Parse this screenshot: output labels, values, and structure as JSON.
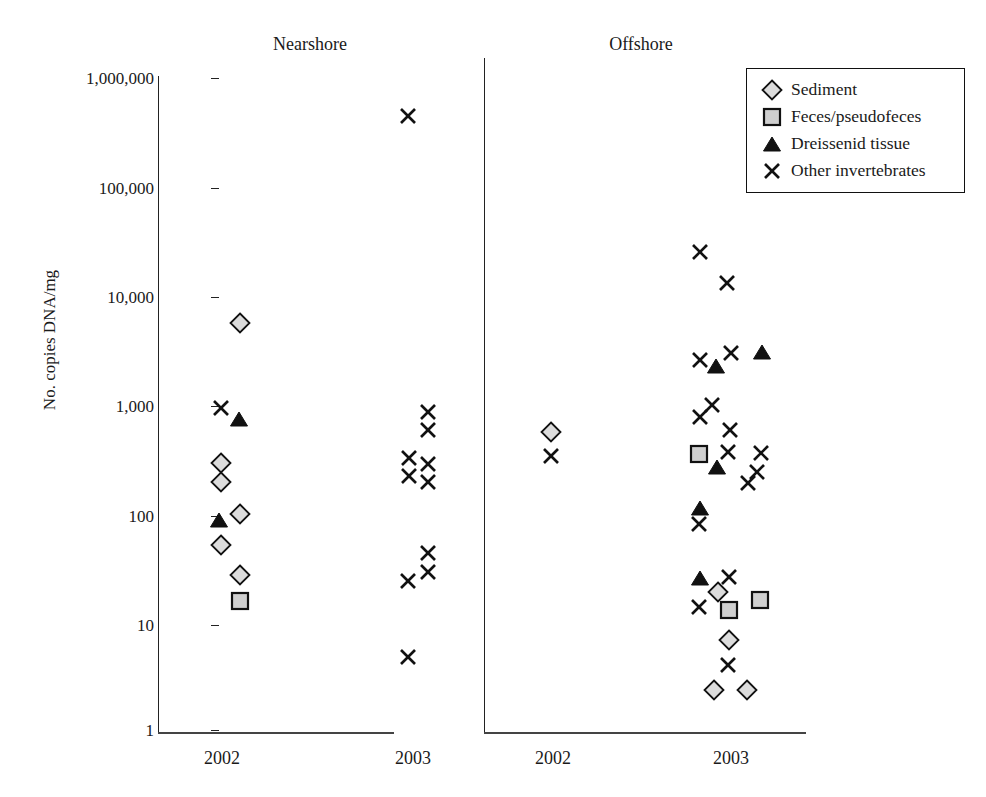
{
  "chart_data": {
    "type": "scatter",
    "title": "",
    "xlabel": "",
    "ylabel": "No. copies DNA/mg",
    "yscale": "log",
    "ylim": [
      1,
      1000000
    ],
    "yticks": [
      {
        "value": 1000000,
        "label": "1,000,000"
      },
      {
        "value": 100000,
        "label": "100,000"
      },
      {
        "value": 10000,
        "label": "10,000"
      },
      {
        "value": 1000,
        "label": "1,000"
      },
      {
        "value": 100,
        "label": "100"
      },
      {
        "value": 10,
        "label": "10"
      },
      {
        "value": 1,
        "label": "1"
      }
    ],
    "grid": false,
    "legend_position": "top-right",
    "panels": [
      {
        "name": "Nearshore",
        "groups": [
          "2002",
          "2003"
        ]
      },
      {
        "name": "Offshore",
        "groups": [
          "2002",
          "2003"
        ]
      }
    ],
    "series": [
      {
        "name": "Sediment",
        "marker": "diamond",
        "fill": "#d9d9d9",
        "stroke": "#111111"
      },
      {
        "name": "Feces/pseudofeces",
        "marker": "square",
        "fill": "#cccccc",
        "stroke": "#111111"
      },
      {
        "name": "Dreissenid tissue",
        "marker": "triangle",
        "fill": "#111111",
        "stroke": "#111111"
      },
      {
        "name": "Other invertebrates",
        "marker": "x",
        "fill": "none",
        "stroke": "#111111"
      }
    ],
    "points": [
      {
        "panel": "Nearshore",
        "group": "2002",
        "series": "Sediment",
        "value": 5500,
        "px": 240,
        "py": 323
      },
      {
        "panel": "Nearshore",
        "group": "2002",
        "series": "Other invertebrates",
        "value": 900,
        "px": 221,
        "py": 408
      },
      {
        "panel": "Nearshore",
        "group": "2002",
        "series": "Dreissenid tissue",
        "value": 750,
        "px": 239,
        "py": 419
      },
      {
        "panel": "Nearshore",
        "group": "2002",
        "series": "Sediment",
        "value": 290,
        "px": 221,
        "py": 463
      },
      {
        "panel": "Nearshore",
        "group": "2002",
        "series": "Sediment",
        "value": 220,
        "px": 221,
        "py": 482
      },
      {
        "panel": "Nearshore",
        "group": "2002",
        "series": "Sediment",
        "value": 100,
        "px": 240,
        "py": 514
      },
      {
        "panel": "Nearshore",
        "group": "2002",
        "series": "Dreissenid tissue",
        "value": 85,
        "px": 219,
        "py": 520
      },
      {
        "panel": "Nearshore",
        "group": "2002",
        "series": "Sediment",
        "value": 55,
        "px": 221,
        "py": 545
      },
      {
        "panel": "Nearshore",
        "group": "2002",
        "series": "Sediment",
        "value": 28,
        "px": 240,
        "py": 575
      },
      {
        "panel": "Nearshore",
        "group": "2002",
        "series": "Feces/pseudofeces",
        "value": 17,
        "px": 240,
        "py": 601
      },
      {
        "panel": "Nearshore",
        "group": "2003",
        "series": "Other invertebrates",
        "value": 420000,
        "px": 408,
        "py": 116
      },
      {
        "panel": "Nearshore",
        "group": "2003",
        "series": "Other invertebrates",
        "value": 850,
        "px": 428,
        "py": 412
      },
      {
        "panel": "Nearshore",
        "group": "2003",
        "series": "Other invertebrates",
        "value": 640,
        "px": 428,
        "py": 430
      },
      {
        "panel": "Nearshore",
        "group": "2003",
        "series": "Other invertebrates",
        "value": 340,
        "px": 409,
        "py": 458
      },
      {
        "panel": "Nearshore",
        "group": "2003",
        "series": "Other invertebrates",
        "value": 290,
        "px": 428,
        "py": 464
      },
      {
        "panel": "Nearshore",
        "group": "2003",
        "series": "Other invertebrates",
        "value": 230,
        "px": 409,
        "py": 476
      },
      {
        "panel": "Nearshore",
        "group": "2003",
        "series": "Other invertebrates",
        "value": 190,
        "px": 428,
        "py": 482
      },
      {
        "panel": "Nearshore",
        "group": "2003",
        "series": "Other invertebrates",
        "value": 38,
        "px": 428,
        "py": 553
      },
      {
        "panel": "Nearshore",
        "group": "2003",
        "series": "Other invertebrates",
        "value": 27,
        "px": 428,
        "py": 572
      },
      {
        "panel": "Nearshore",
        "group": "2003",
        "series": "Other invertebrates",
        "value": 25,
        "px": 408,
        "py": 581
      },
      {
        "panel": "Nearshore",
        "group": "2003",
        "series": "Other invertebrates",
        "value": 5,
        "px": 408,
        "py": 657
      },
      {
        "panel": "Offshore",
        "group": "2002",
        "series": "Sediment",
        "value": 540,
        "px": 551,
        "py": 432
      },
      {
        "panel": "Offshore",
        "group": "2002",
        "series": "Other invertebrates",
        "value": 330,
        "px": 551,
        "py": 456
      },
      {
        "panel": "Offshore",
        "group": "2003",
        "series": "Other invertebrates",
        "value": 24000,
        "px": 700,
        "py": 252
      },
      {
        "panel": "Offshore",
        "group": "2003",
        "series": "Other invertebrates",
        "value": 12000,
        "px": 727,
        "py": 283
      },
      {
        "panel": "Offshore",
        "group": "2003",
        "series": "Other invertebrates",
        "value": 3000,
        "px": 731,
        "py": 353
      },
      {
        "panel": "Offshore",
        "group": "2003",
        "series": "Dreissenid tissue",
        "value": 2700,
        "px": 762,
        "py": 352
      },
      {
        "panel": "Offshore",
        "group": "2003",
        "series": "Other invertebrates",
        "value": 2400,
        "px": 700,
        "py": 360
      },
      {
        "panel": "Offshore",
        "group": "2003",
        "series": "Dreissenid tissue",
        "value": 2200,
        "px": 716,
        "py": 366
      },
      {
        "panel": "Offshore",
        "group": "2003",
        "series": "Other invertebrates",
        "value": 1000,
        "px": 712,
        "py": 405
      },
      {
        "panel": "Offshore",
        "group": "2003",
        "series": "Other invertebrates",
        "value": 750,
        "px": 700,
        "py": 417
      },
      {
        "panel": "Offshore",
        "group": "2003",
        "series": "Other invertebrates",
        "value": 600,
        "px": 730,
        "py": 430
      },
      {
        "panel": "Offshore",
        "group": "2003",
        "series": "Other invertebrates",
        "value": 400,
        "px": 728,
        "py": 452
      },
      {
        "panel": "Offshore",
        "group": "2003",
        "series": "Feces/pseudofeces",
        "value": 340,
        "px": 699,
        "py": 454
      },
      {
        "panel": "Offshore",
        "group": "2003",
        "series": "Other invertebrates",
        "value": 360,
        "px": 761,
        "py": 453
      },
      {
        "panel": "Offshore",
        "group": "2003",
        "series": "Dreissenid tissue",
        "value": 260,
        "px": 717,
        "py": 467
      },
      {
        "panel": "Offshore",
        "group": "2003",
        "series": "Other invertebrates",
        "value": 240,
        "px": 757,
        "py": 472
      },
      {
        "panel": "Offshore",
        "group": "2003",
        "series": "Other invertebrates",
        "value": 190,
        "px": 748,
        "py": 483
      },
      {
        "panel": "Offshore",
        "group": "2003",
        "series": "Dreissenid tissue",
        "value": 120,
        "px": 700,
        "py": 508
      },
      {
        "panel": "Offshore",
        "group": "2003",
        "series": "Other invertebrates",
        "value": 80,
        "px": 699,
        "py": 524
      },
      {
        "panel": "Offshore",
        "group": "2003",
        "series": "Dreissenid tissue",
        "value": 22,
        "px": 700,
        "py": 578
      },
      {
        "panel": "Offshore",
        "group": "2003",
        "series": "Other invertebrates",
        "value": 26,
        "px": 729,
        "py": 577
      },
      {
        "panel": "Offshore",
        "group": "2003",
        "series": "Sediment",
        "value": 19,
        "px": 718,
        "py": 592
      },
      {
        "panel": "Offshore",
        "group": "2003",
        "series": "Other invertebrates",
        "value": 14,
        "px": 699,
        "py": 607
      },
      {
        "panel": "Offshore",
        "group": "2003",
        "series": "Feces/pseudofeces",
        "value": 13,
        "px": 729,
        "py": 610
      },
      {
        "panel": "Offshore",
        "group": "2003",
        "series": "Feces/pseudofeces",
        "value": 17,
        "px": 760,
        "py": 600
      },
      {
        "panel": "Offshore",
        "group": "2003",
        "series": "Sediment",
        "value": 7,
        "px": 729,
        "py": 640
      },
      {
        "panel": "Offshore",
        "group": "2003",
        "series": "Other invertebrates",
        "value": 4,
        "px": 728,
        "py": 665
      },
      {
        "panel": "Offshore",
        "group": "2003",
        "series": "Sediment",
        "value": 2.5,
        "px": 714,
        "py": 690
      },
      {
        "panel": "Offshore",
        "group": "2003",
        "series": "Sediment",
        "value": 2.5,
        "px": 747,
        "py": 690
      }
    ]
  },
  "legend": {
    "items": [
      {
        "label": "Sediment",
        "marker": "diamond"
      },
      {
        "label": "Feces/pseudofeces",
        "marker": "square"
      },
      {
        "label": "Dreissenid tissue",
        "marker": "triangle"
      },
      {
        "label": "Other invertebrates",
        "marker": "x"
      }
    ]
  },
  "colors": {
    "axis": "#222222",
    "marker_stroke": "#111111",
    "marker_fill": "#d9d9d9",
    "background": "#ffffff"
  }
}
